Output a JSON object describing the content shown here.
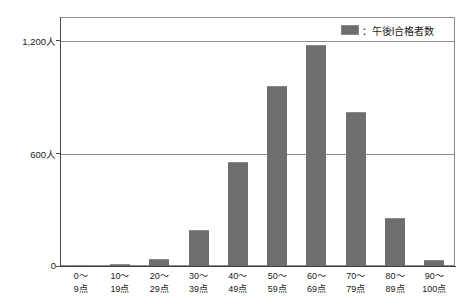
{
  "chart_data": {
    "type": "bar",
    "title": "",
    "subtitle": "",
    "xlabel": "",
    "ylabel": "",
    "categories": [
      "0〜\n9点",
      "10〜\n19点",
      "20〜\n29点",
      "30〜\n39点",
      "40〜\n49点",
      "50〜\n59点",
      "60〜\n69点",
      "70〜\n79点",
      "80〜\n89点",
      "90〜\n100点"
    ],
    "category_lines": [
      {
        "line1": "0〜",
        "line2": "9点"
      },
      {
        "line1": "10〜",
        "line2": "19点"
      },
      {
        "line1": "20〜",
        "line2": "29点"
      },
      {
        "line1": "30〜",
        "line2": "39点"
      },
      {
        "line1": "40〜",
        "line2": "49点"
      },
      {
        "line1": "50〜",
        "line2": "59点"
      },
      {
        "line1": "60〜",
        "line2": "69点"
      },
      {
        "line1": "70〜",
        "line2": "79点"
      },
      {
        "line1": "80〜",
        "line2": "89点"
      },
      {
        "line1": "90〜",
        "line2": "100点"
      }
    ],
    "series": [
      {
        "name": "午後I合格者数",
        "color": "#6e6e6e",
        "values": [
          8,
          10,
          40,
          190,
          555,
          960,
          1180,
          825,
          255,
          30
        ]
      }
    ],
    "ylim": [
      0,
      1325
    ],
    "yticks": [
      0,
      600,
      1200
    ],
    "ytick_labels": [
      "0",
      "600人",
      "1,200人"
    ],
    "grid": true,
    "gridlines_at": [
      600,
      1200
    ],
    "legend": {
      "position": "top-right",
      "entries": [
        {
          "label": "：午後I合格者数",
          "color": "#6e6e6e"
        }
      ]
    }
  },
  "colors": {
    "bar": "#6e6e6e",
    "axis": "#4a4a4a",
    "grid": "#8d8d8d",
    "background": "#ffffff",
    "text": "#1a1a1a"
  }
}
